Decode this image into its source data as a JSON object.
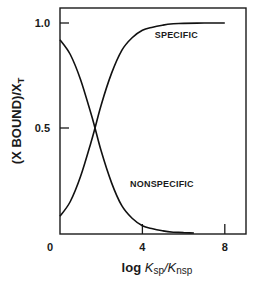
{
  "chart_data": {
    "type": "line",
    "title": "",
    "xlabel": "log K_sp/K_nsp",
    "xlabel_parts": {
      "prefix": "log",
      "num_sym": "K",
      "num_sub": "sp",
      "sep": "/",
      "den_sym": "K",
      "den_sub": "nsp"
    },
    "ylabel": "(X BOUND)/X_T",
    "ylabel_parts": {
      "main": "(X BOUND)/X",
      "sub": "T"
    },
    "xlim": [
      0,
      8.5
    ],
    "ylim": [
      0,
      1.05
    ],
    "x_ticks": [
      0,
      4,
      8
    ],
    "x_tick_labels": [
      "0",
      "4",
      "8"
    ],
    "y_ticks": [
      0.5,
      1.0
    ],
    "y_tick_labels": [
      "0.5",
      "1.0"
    ],
    "grid": false,
    "legend": "none (inline annotations)",
    "series": [
      {
        "name": "SPECIFIC",
        "x": [
          0,
          0.5,
          1.0,
          1.5,
          1.7,
          2.0,
          2.5,
          3.0,
          3.5,
          4.0,
          4.5,
          5.0,
          5.5,
          6.0,
          7.0,
          8.0
        ],
        "values": [
          0.08,
          0.15,
          0.27,
          0.43,
          0.5,
          0.61,
          0.76,
          0.87,
          0.93,
          0.965,
          0.98,
          0.99,
          0.996,
          0.998,
          1.0,
          1.0
        ]
      },
      {
        "name": "NONSPECIFIC",
        "x": [
          0,
          0.5,
          1.0,
          1.5,
          1.7,
          2.0,
          2.5,
          3.0,
          3.5,
          4.0,
          4.5,
          5.0,
          5.5,
          6.0,
          6.5
        ],
        "values": [
          0.92,
          0.85,
          0.73,
          0.57,
          0.5,
          0.39,
          0.24,
          0.13,
          0.07,
          0.035,
          0.02,
          0.01,
          0.004,
          0.002,
          0.0
        ]
      }
    ],
    "annotations": [
      {
        "text": "SPECIFIC",
        "x": 4.6,
        "y": 0.93
      },
      {
        "text": "NONSPECIFIC",
        "x": 3.4,
        "y": 0.22
      }
    ]
  }
}
